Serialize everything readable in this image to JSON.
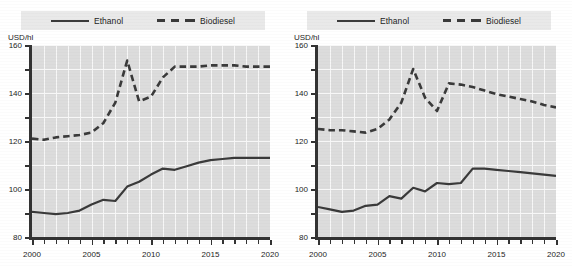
{
  "figure": {
    "titles": {
      "left": "",
      "right": ""
    }
  },
  "legend": {
    "ethanol_label": "Ethanol",
    "biodiesel_label": "Biodiesel",
    "ethanol_style": "solid-line-swatch",
    "biodiesel_style": "dashed-line-swatch"
  },
  "axis": {
    "y_unit": "USD/hl",
    "y_ticks": [
      0,
      20,
      40,
      60,
      80,
      100,
      120,
      140,
      160
    ],
    "x_labels": [
      "2000",
      "2005",
      "2010",
      "2015",
      "2020"
    ],
    "x_min": 2000,
    "x_max": 2020,
    "y_min": 0,
    "y_max": 160
  },
  "colors": {
    "line": "#3a3a3a",
    "plot_background": "#dcdcdc",
    "gridline": "#f7f7f7",
    "legend_background": "#e9e9e9",
    "axis": "#333333",
    "text": "#1d1d1d"
  },
  "chart_data": [
    {
      "type": "line",
      "id": "chart-left",
      "title": "",
      "xlabel": "",
      "ylabel": "USD/hl",
      "xlim": [
        2000,
        2020
      ],
      "ylim": [
        0,
        160
      ],
      "grid": true,
      "legend_position": "top",
      "x": [
        2000,
        2001,
        2002,
        2003,
        2004,
        2005,
        2006,
        2007,
        2008,
        2009,
        2010,
        2011,
        2012,
        2013,
        2014,
        2015,
        2016,
        2017,
        2018,
        2019,
        2020
      ],
      "series": [
        {
          "name": "Ethanol",
          "style": "solid",
          "values": [
            21,
            20,
            19,
            20,
            22,
            27,
            31,
            30,
            42,
            46,
            52,
            57,
            56,
            59,
            62,
            64,
            65,
            66,
            66,
            66,
            66
          ]
        },
        {
          "name": "Biodiesel",
          "style": "dashed",
          "values": [
            82,
            81,
            83,
            84,
            85,
            87,
            95,
            112,
            147,
            113,
            117,
            133,
            142,
            142,
            142,
            143,
            143,
            143,
            142,
            142,
            142
          ]
        }
      ]
    },
    {
      "type": "line",
      "id": "chart-right",
      "title": "",
      "xlabel": "",
      "ylabel": "USD/hl",
      "xlim": [
        2000,
        2020
      ],
      "ylim": [
        0,
        160
      ],
      "grid": true,
      "legend_position": "top",
      "x": [
        2000,
        2001,
        2002,
        2003,
        2004,
        2005,
        2006,
        2007,
        2008,
        2009,
        2010,
        2011,
        2012,
        2013,
        2014,
        2015,
        2016,
        2017,
        2018,
        2019,
        2020
      ],
      "series": [
        {
          "name": "Ethanol",
          "style": "solid",
          "values": [
            25,
            23,
            21,
            22,
            26,
            27,
            34,
            32,
            41,
            38,
            45,
            44,
            45,
            57,
            57,
            56,
            55,
            54,
            53,
            52,
            51
          ]
        },
        {
          "name": "Biodiesel",
          "style": "dashed",
          "values": [
            90,
            89,
            89,
            88,
            87,
            90,
            98,
            112,
            140,
            116,
            105,
            128,
            127,
            125,
            122,
            119,
            117,
            115,
            113,
            110,
            108
          ]
        }
      ]
    }
  ]
}
